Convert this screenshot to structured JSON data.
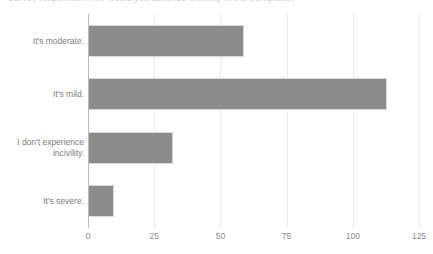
{
  "chart_data": {
    "type": "bar",
    "orientation": "horizontal",
    "title": "",
    "xlabel": "",
    "ylabel": "",
    "categories": [
      "It's moderate.",
      "It's mild.",
      "I don't experience incivility.",
      "It's severe."
    ],
    "values": [
      59,
      113,
      32,
      10
    ],
    "xlim": [
      0,
      125
    ],
    "xticks": [
      0,
      25,
      50,
      75,
      100,
      125
    ],
    "xtick_labels": [
      "0",
      "25",
      "50",
      "75",
      "100",
      "125"
    ],
    "grid": "vertical",
    "legend": "none",
    "bar_color": "#8c8c8c",
    "bar_border_color": "#d8d8d8",
    "gridline_color": "#e9e9e9",
    "axis_color": "#b9b9b9",
    "label_color": "#7d7d7d",
    "tick_label_color": "#8a8a8a",
    "background": "#ffffff"
  },
  "title_strip": {
    "clipped_title": "Survey responses: How would you describe incivility in the workplace?"
  },
  "category_label_lines": [
    [
      "It's moderate."
    ],
    [
      "It's mild."
    ],
    [
      "I don't experience",
      "incivility."
    ],
    [
      "It's severe."
    ]
  ]
}
